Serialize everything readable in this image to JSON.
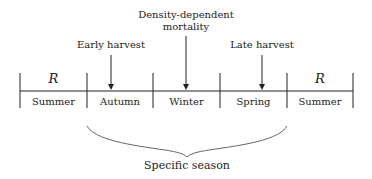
{
  "diagram": {
    "seasons": [
      "Summer",
      "Autumn",
      "Winter",
      "Spring",
      "Summer"
    ],
    "r_labels": [
      {
        "segment": 0,
        "text": "R"
      },
      {
        "segment": 4,
        "text": "R"
      }
    ],
    "events": [
      {
        "label": "Early harvest",
        "line1": "Early harvest",
        "line2": "",
        "segment": 1
      },
      {
        "label": "Density-dependent mortality",
        "line1": "Density-dependent",
        "line2": "mortality",
        "segment": 2
      },
      {
        "label": "Late harvest",
        "line1": "Late harvest",
        "line2": "",
        "segment": 3
      }
    ],
    "brace_label": "Specific season",
    "brace_span": [
      "Autumn",
      "Winter",
      "Spring"
    ],
    "colors": {
      "line": "#222222",
      "brace": "#666666"
    }
  }
}
